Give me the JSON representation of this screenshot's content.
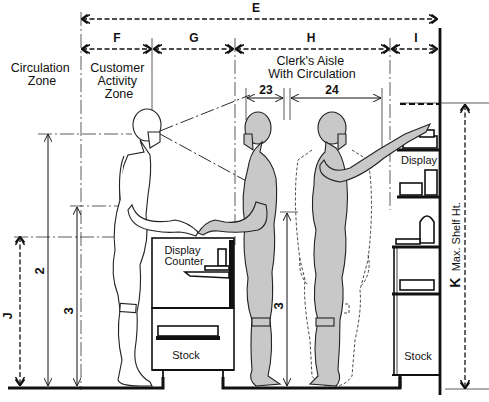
{
  "diagram": {
    "type": "anthropometric elevation / retail counter section",
    "dimensions": {
      "E": "E",
      "F": "F",
      "G": "G",
      "H": "H",
      "I": "I",
      "J": "J",
      "K": "K",
      "d23": "23",
      "d24": "24",
      "d2": "2",
      "d3_left": "3",
      "d3_right": "3"
    },
    "zones": {
      "circulation_line1": "Circulation",
      "circulation_line2": "Zone",
      "customer_line1": "Customer",
      "customer_line2": "Activity",
      "customer_line3": "Zone",
      "clerk_line1": "Clerk's Aisle",
      "clerk_line2": "With Circulation"
    },
    "labels": {
      "display_counter_1": "Display",
      "display_counter_2": "Counter",
      "stock_left": "Stock",
      "display_right": "Display",
      "stock_right": "Stock",
      "max_shelf": "Max. Shelf Ht."
    },
    "figures": [
      {
        "role": "customer",
        "style": "outline"
      },
      {
        "role": "clerk",
        "style": "shaded"
      },
      {
        "role": "clerk reaching",
        "style": "shaded with dashed clearance envelope"
      }
    ]
  }
}
